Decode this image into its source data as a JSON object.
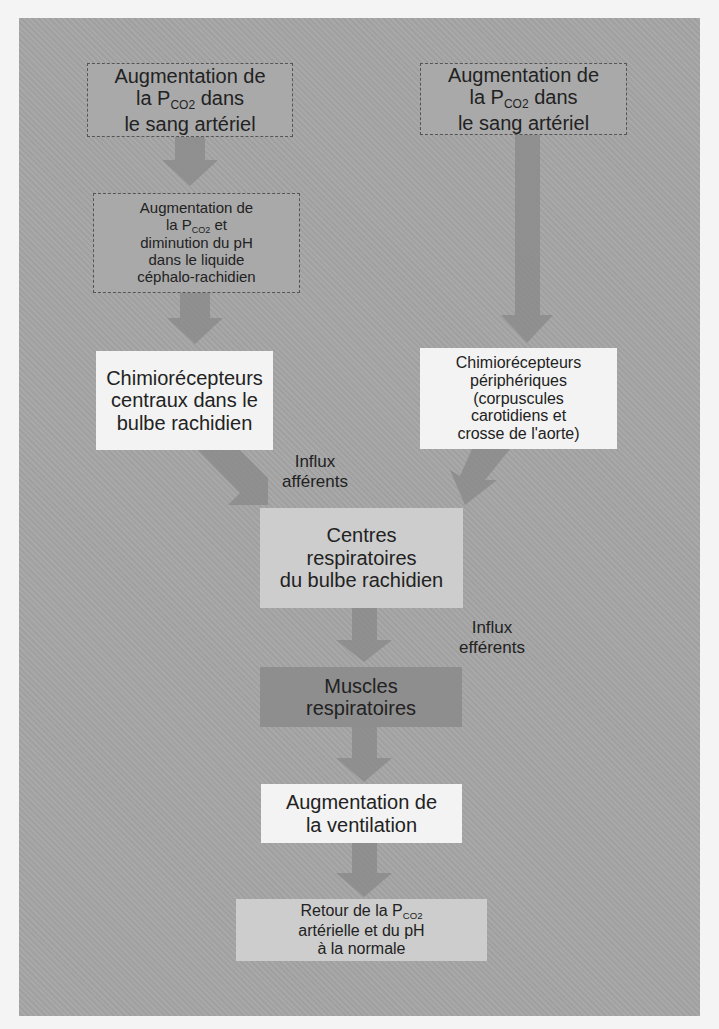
{
  "diagram": {
    "title": "",
    "colors": {
      "panel": "#a5a5a5",
      "arrow": "#8c8c8c",
      "box_white": "#f3f3f3",
      "box_light": "#cdcdcd",
      "box_dark": "#8e8e8e"
    },
    "nodes": {
      "pco2_left": {
        "line1": "Augmentation de",
        "line2_pre": "la P",
        "line2_sub": "CO2",
        "line2_post": " dans",
        "line3": "le sang artériel"
      },
      "pco2_right": {
        "line1": "Augmentation de",
        "line2_pre": "la P",
        "line2_sub": "CO2",
        "line2_post": " dans",
        "line3": "le sang artériel"
      },
      "csf": {
        "line1": "Augmentation de",
        "line2_pre": "la P",
        "line2_sub": "CO2",
        "line2_post": " et",
        "line3": "diminution du pH",
        "line4": "dans le liquide",
        "line5": "céphalo-rachidien"
      },
      "central_chemo": {
        "line1": "Chimiorécepteurs",
        "line2": "centraux dans le",
        "line3": "bulbe rachidien"
      },
      "peripheral_chemo": {
        "line1": "Chimiorécepteurs",
        "line2": "périphériques",
        "line3": "(corpuscules",
        "line4": "carotidiens et",
        "line5": "crosse de l'aorte)"
      },
      "centres": {
        "line1": "Centres",
        "line2": "respiratoires",
        "line3": "du bulbe rachidien"
      },
      "muscles": {
        "line1": "Muscles",
        "line2": "respiratoires"
      },
      "ventilation": {
        "line1": "Augmentation de",
        "line2": "la ventilation"
      },
      "retour": {
        "line1_pre": "Retour de la P",
        "line1_sub": "CO2",
        "line2": "artérielle et du pH",
        "line3": "à la normale"
      }
    },
    "labels": {
      "afferent": {
        "line1": "Influx",
        "line2": "afférents"
      },
      "efferent": {
        "line1": "Influx",
        "line2": "efférents"
      }
    },
    "edges": [
      {
        "from": "pco2_left",
        "to": "csf"
      },
      {
        "from": "csf",
        "to": "central_chemo"
      },
      {
        "from": "pco2_right",
        "to": "peripheral_chemo"
      },
      {
        "from": "central_chemo",
        "to": "centres",
        "label": "afferent"
      },
      {
        "from": "peripheral_chemo",
        "to": "centres",
        "label": "afferent"
      },
      {
        "from": "centres",
        "to": "muscles",
        "label": "efferent"
      },
      {
        "from": "muscles",
        "to": "ventilation"
      },
      {
        "from": "ventilation",
        "to": "retour"
      }
    ]
  }
}
